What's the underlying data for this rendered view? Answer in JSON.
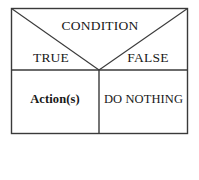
{
  "diagram": {
    "type": "decision-table",
    "title_cell": {
      "label": "CONDITION"
    },
    "branch_cells": [
      {
        "name": "true-branch",
        "label": "TRUE"
      },
      {
        "name": "false-branch",
        "label": "FALSE"
      }
    ],
    "action_cells": [
      {
        "name": "actions-cell",
        "label": "Action(s)",
        "bold": true
      },
      {
        "name": "do-nothing-cell",
        "label": "DO NOTHING",
        "bold": false
      }
    ],
    "geometry": {
      "outer_rect": {
        "x": 11,
        "y": 8,
        "width": 177,
        "height": 126
      },
      "horizontal_divider_y": 70,
      "vertical_divider_x": 99,
      "v_apex": {
        "x": 99,
        "y": 70
      }
    },
    "colors": {
      "background": "#ffffff",
      "stroke": "#3a3a3a",
      "text": "#181818"
    }
  }
}
